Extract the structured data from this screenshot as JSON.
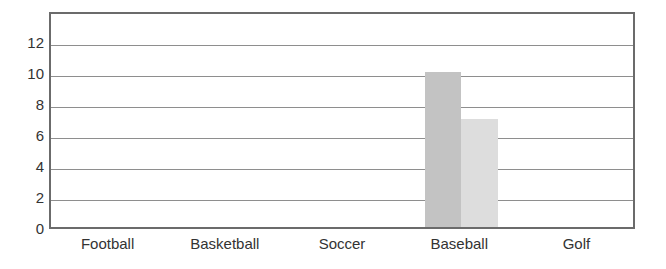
{
  "chart_data": {
    "type": "bar",
    "title": "",
    "subtitle": "",
    "xlabel": "",
    "ylabel": "",
    "categories": [
      "Football",
      "Basketball",
      "Soccer",
      "Baseball",
      "Golf"
    ],
    "series": [
      {
        "name": "Series 1",
        "color": "#c3c3c3",
        "values": [
          0,
          0,
          0,
          10,
          0
        ]
      },
      {
        "name": "Series 2",
        "color": "#dddddd",
        "values": [
          0,
          0,
          0,
          7,
          0
        ]
      }
    ],
    "ylim": [
      0,
      14
    ],
    "ytick_values": [
      0,
      2,
      4,
      6,
      8,
      10,
      12
    ],
    "ytick_labels": [
      "0",
      "2",
      "4",
      "6",
      "8",
      "10",
      "12"
    ],
    "grid": "horizontal",
    "legend": "none",
    "annotations": []
  },
  "style": {
    "frame_color": "#6b6b6b",
    "gridline_color": "#8e8e8e",
    "background": "#ffffff",
    "text_color": "#333333"
  }
}
